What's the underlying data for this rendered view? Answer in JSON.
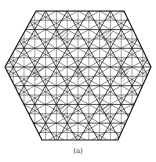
{
  "figure": {
    "caption": "(a)",
    "stroke_color": "#1a1a1a",
    "hatch_color": "#333333",
    "background": "#ffffff",
    "hexagon": {
      "top_left": [
        36,
        11
      ],
      "top_right": [
        124,
        11
      ],
      "right": [
        151,
        67
      ],
      "bottom_right": [
        118,
        140
      ],
      "bottom_left": [
        42,
        140
      ],
      "left": [
        5,
        67
      ]
    },
    "hatched_triangles": [
      {
        "row": 1,
        "points": [
          [
            55,
            30
          ],
          [
            71,
            30
          ],
          [
            63,
            45
          ]
        ]
      },
      {
        "row": 1,
        "points": [
          [
            98,
            30
          ],
          [
            114,
            30
          ],
          [
            106,
            45
          ]
        ]
      },
      {
        "row": 2,
        "points": [
          [
            28,
            67
          ],
          [
            45,
            67
          ],
          [
            36,
            82
          ]
        ]
      },
      {
        "row": 2,
        "points": [
          [
            72,
            67
          ],
          [
            88,
            67
          ],
          [
            80,
            82
          ]
        ]
      },
      {
        "row": 2,
        "points": [
          [
            115,
            67
          ],
          [
            131,
            67
          ],
          [
            123,
            82
          ]
        ]
      },
      {
        "row": 3,
        "points": [
          [
            55,
            104
          ],
          [
            71,
            104
          ],
          [
            63,
            119
          ]
        ]
      },
      {
        "row": 3,
        "points": [
          [
            98,
            104
          ],
          [
            114,
            104
          ],
          [
            106,
            119
          ]
        ]
      }
    ]
  }
}
